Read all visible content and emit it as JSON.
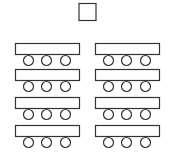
{
  "diagram": {
    "title": "",
    "kind": "classroom-seating-layout",
    "stroke_color": "#333333",
    "fill_color": "#ffffff",
    "teacher_desk": {
      "label": ""
    },
    "columns": 2,
    "rows": 4,
    "seats_per_desk": 3,
    "desk_groups": [
      {
        "column": "left",
        "row": 1,
        "seats": 3
      },
      {
        "column": "right",
        "row": 1,
        "seats": 3
      },
      {
        "column": "left",
        "row": 2,
        "seats": 3
      },
      {
        "column": "right",
        "row": 2,
        "seats": 3
      },
      {
        "column": "left",
        "row": 3,
        "seats": 3
      },
      {
        "column": "right",
        "row": 3,
        "seats": 3
      },
      {
        "column": "left",
        "row": 4,
        "seats": 3
      },
      {
        "column": "right",
        "row": 4,
        "seats": 3
      }
    ]
  }
}
